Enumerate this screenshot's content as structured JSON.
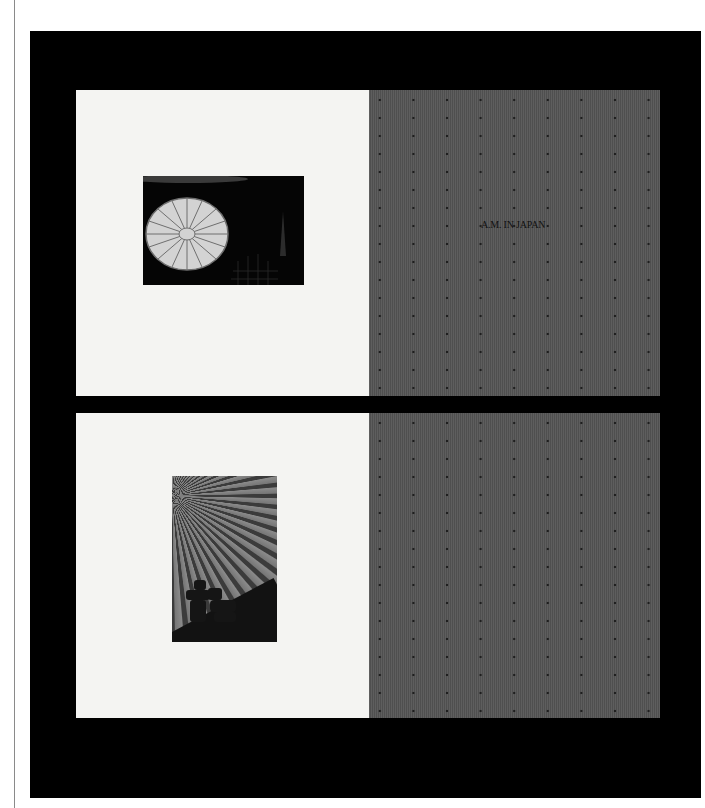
{
  "document": {
    "spreads": [
      {
        "id": "top",
        "left_page": {
          "image": "chrysanthemum-crest-photo"
        },
        "right_page": {
          "title": "A.M. IN JAPAN",
          "pattern": "dotted-gray"
        }
      },
      {
        "id": "bottom",
        "left_page": {
          "image": "paper-umbrella-photo"
        },
        "right_page": {
          "title": "",
          "pattern": "dotted-gray"
        }
      }
    ]
  },
  "colors": {
    "frame": "#000000",
    "page_light": "#f4f4f2",
    "page_gray": "#585858",
    "dot": "#1e1e1e"
  }
}
